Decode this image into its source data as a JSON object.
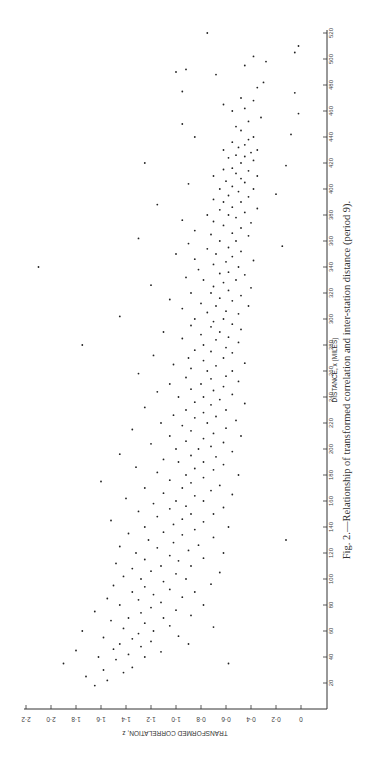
{
  "figure": {
    "caption": "Fig. 2.—Relationship of transformed correlation and inter-station distance (period 9).",
    "orientation": "rotated 90° counter-clockwise"
  },
  "chart_data": {
    "type": "scatter",
    "title": "Relationship of transformed correlation and inter-station distance (period 9)",
    "xlabel": "DISTANCE, x (MILES)",
    "ylabel": "TRANSFORMED CORRELATION, z",
    "xlim": [
      0,
      520
    ],
    "ylim": [
      0,
      2.2
    ],
    "x_ticks": [
      20,
      40,
      60,
      80,
      100,
      120,
      140,
      160,
      180,
      200,
      220,
      240,
      260,
      280,
      300,
      320,
      340,
      360,
      380,
      400,
      420,
      440,
      460,
      480,
      500,
      520
    ],
    "y_ticks": [
      "0",
      "0·2",
      "0·4",
      "0·6",
      "0·8",
      "1·0",
      "1·2",
      "1·4",
      "1·6",
      "1·8",
      "2·0",
      "2·2"
    ],
    "grid": false,
    "legend": null,
    "trend_description": "Dense cloud decreasing from z≈1.3 near 20 mi to z≈0.45 near 450 mi; scattered outliers up to z≈2.1",
    "points": [
      [
        18,
        1.65
      ],
      [
        22,
        1.55
      ],
      [
        25,
        1.72
      ],
      [
        28,
        1.42
      ],
      [
        30,
        1.58
      ],
      [
        32,
        1.35
      ],
      [
        35,
        1.9
      ],
      [
        35,
        0.58
      ],
      [
        38,
        1.48
      ],
      [
        40,
        1.25
      ],
      [
        40,
        1.62
      ],
      [
        42,
        1.38
      ],
      [
        44,
        1.12
      ],
      [
        45,
        1.8
      ],
      [
        46,
        1.5
      ],
      [
        48,
        1.28
      ],
      [
        50,
        1.45
      ],
      [
        50,
        0.9
      ],
      [
        52,
        1.2
      ],
      [
        54,
        1.35
      ],
      [
        55,
        1.58
      ],
      [
        56,
        0.98
      ],
      [
        58,
        1.3
      ],
      [
        60,
        1.18
      ],
      [
        60,
        1.75
      ],
      [
        62,
        1.42
      ],
      [
        63,
        0.7
      ],
      [
        64,
        1.05
      ],
      [
        66,
        1.25
      ],
      [
        68,
        1.52
      ],
      [
        70,
        1.1
      ],
      [
        70,
        1.38
      ],
      [
        72,
        0.88
      ],
      [
        74,
        1.28
      ],
      [
        75,
        1.65
      ],
      [
        76,
        1.0
      ],
      [
        78,
        1.2
      ],
      [
        80,
        1.45
      ],
      [
        80,
        0.78
      ],
      [
        82,
        1.12
      ],
      [
        84,
        1.3
      ],
      [
        85,
        1.55
      ],
      [
        86,
        0.95
      ],
      [
        88,
        1.18
      ],
      [
        90,
        1.35
      ],
      [
        90,
        0.85
      ],
      [
        92,
        1.05
      ],
      [
        94,
        1.25
      ],
      [
        95,
        1.5
      ],
      [
        96,
        0.72
      ],
      [
        98,
        1.1
      ],
      [
        100,
        1.28
      ],
      [
        100,
        0.92
      ],
      [
        102,
        1.42
      ],
      [
        104,
        1.0
      ],
      [
        105,
        0.65
      ],
      [
        106,
        1.2
      ],
      [
        108,
        1.35
      ],
      [
        110,
        0.88
      ],
      [
        110,
        1.12
      ],
      [
        112,
        1.48
      ],
      [
        114,
        0.98
      ],
      [
        115,
        1.25
      ],
      [
        116,
        0.78
      ],
      [
        118,
        1.05
      ],
      [
        120,
        1.32
      ],
      [
        120,
        0.62
      ],
      [
        122,
        0.9
      ],
      [
        124,
        1.15
      ],
      [
        125,
        1.45
      ],
      [
        126,
        0.82
      ],
      [
        128,
        1.02
      ],
      [
        130,
        1.22
      ],
      [
        130,
        0.12
      ],
      [
        132,
        0.7
      ],
      [
        134,
        0.95
      ],
      [
        135,
        1.38
      ],
      [
        136,
        1.1
      ],
      [
        138,
        0.85
      ],
      [
        140,
        1.25
      ],
      [
        140,
        0.58
      ],
      [
        142,
        1.02
      ],
      [
        144,
        0.78
      ],
      [
        145,
        1.52
      ],
      [
        146,
        0.95
      ],
      [
        148,
        1.15
      ],
      [
        150,
        0.7
      ],
      [
        150,
        0.88
      ],
      [
        152,
        1.3
      ],
      [
        154,
        1.05
      ],
      [
        155,
        0.62
      ],
      [
        156,
        0.92
      ],
      [
        158,
        1.18
      ],
      [
        160,
        0.78
      ],
      [
        160,
        1.0
      ],
      [
        162,
        1.4
      ],
      [
        164,
        0.85
      ],
      [
        165,
        0.55
      ],
      [
        166,
        1.1
      ],
      [
        168,
        0.72
      ],
      [
        170,
        0.95
      ],
      [
        170,
        1.25
      ],
      [
        172,
        0.65
      ],
      [
        174,
        0.88
      ],
      [
        175,
        1.6
      ],
      [
        176,
        1.05
      ],
      [
        178,
        0.78
      ],
      [
        180,
        0.92
      ],
      [
        180,
        0.5
      ],
      [
        182,
        1.15
      ],
      [
        184,
        0.7
      ],
      [
        185,
        0.85
      ],
      [
        186,
        1.32
      ],
      [
        188,
        0.62
      ],
      [
        190,
        0.98
      ],
      [
        190,
        0.78
      ],
      [
        192,
        1.1
      ],
      [
        194,
        0.68
      ],
      [
        195,
        0.88
      ],
      [
        196,
        1.45
      ],
      [
        198,
        0.55
      ],
      [
        200,
        0.82
      ],
      [
        200,
        1.0
      ],
      [
        202,
        0.72
      ],
      [
        204,
        1.2
      ],
      [
        205,
        0.62
      ],
      [
        206,
        0.92
      ],
      [
        208,
        0.78
      ],
      [
        210,
        1.05
      ],
      [
        210,
        0.48
      ],
      [
        212,
        0.7
      ],
      [
        214,
        0.88
      ],
      [
        215,
        1.35
      ],
      [
        216,
        0.6
      ],
      [
        218,
        0.95
      ],
      [
        220,
        0.75
      ],
      [
        220,
        1.12
      ],
      [
        222,
        0.52
      ],
      [
        224,
        0.85
      ],
      [
        225,
        0.68
      ],
      [
        226,
        1.02
      ],
      [
        228,
        0.78
      ],
      [
        230,
        0.6
      ],
      [
        230,
        0.92
      ],
      [
        232,
        1.25
      ],
      [
        234,
        0.72
      ],
      [
        235,
        0.45
      ],
      [
        236,
        0.85
      ],
      [
        238,
        0.65
      ],
      [
        240,
        0.98
      ],
      [
        240,
        0.78
      ],
      [
        242,
        0.55
      ],
      [
        244,
        1.15
      ],
      [
        245,
        0.7
      ],
      [
        246,
        0.88
      ],
      [
        248,
        0.62
      ],
      [
        250,
        0.8
      ],
      [
        250,
        1.05
      ],
      [
        252,
        0.5
      ],
      [
        254,
        0.72
      ],
      [
        255,
        0.92
      ],
      [
        256,
        0.6
      ],
      [
        258,
        1.3
      ],
      [
        260,
        0.75
      ],
      [
        260,
        0.55
      ],
      [
        262,
        0.88
      ],
      [
        264,
        0.68
      ],
      [
        265,
        1.02
      ],
      [
        266,
        0.45
      ],
      [
        268,
        0.78
      ],
      [
        270,
        0.62
      ],
      [
        270,
        0.9
      ],
      [
        272,
        1.18
      ],
      [
        274,
        0.55
      ],
      [
        275,
        0.72
      ],
      [
        276,
        0.85
      ],
      [
        278,
        0.6
      ],
      [
        280,
        0.78
      ],
      [
        280,
        1.75
      ],
      [
        282,
        0.5
      ],
      [
        284,
        0.68
      ],
      [
        285,
        0.95
      ],
      [
        286,
        0.58
      ],
      [
        288,
        0.8
      ],
      [
        290,
        0.65
      ],
      [
        290,
        1.1
      ],
      [
        292,
        0.48
      ],
      [
        294,
        0.72
      ],
      [
        295,
        0.88
      ],
      [
        296,
        0.55
      ],
      [
        298,
        0.7
      ],
      [
        300,
        0.62
      ],
      [
        300,
        0.85
      ],
      [
        302,
        1.45
      ],
      [
        304,
        0.5
      ],
      [
        305,
        0.75
      ],
      [
        306,
        0.6
      ],
      [
        308,
        0.95
      ],
      [
        310,
        0.68
      ],
      [
        310,
        0.42
      ],
      [
        312,
        0.8
      ],
      [
        314,
        0.55
      ],
      [
        315,
        1.05
      ],
      [
        316,
        0.65
      ],
      [
        318,
        0.48
      ],
      [
        320,
        0.72
      ],
      [
        320,
        0.88
      ],
      [
        322,
        0.58
      ],
      [
        324,
        0.4
      ],
      [
        325,
        0.7
      ],
      [
        326,
        1.2
      ],
      [
        328,
        0.62
      ],
      [
        330,
        0.52
      ],
      [
        330,
        0.78
      ],
      [
        332,
        0.92
      ],
      [
        334,
        0.45
      ],
      [
        335,
        0.65
      ],
      [
        336,
        0.58
      ],
      [
        338,
        0.82
      ],
      [
        340,
        0.5
      ],
      [
        340,
        2.1
      ],
      [
        342,
        0.7
      ],
      [
        344,
        0.6
      ],
      [
        345,
        0.38
      ],
      [
        346,
        0.85
      ],
      [
        348,
        0.55
      ],
      [
        350,
        0.68
      ],
      [
        350,
        1.0
      ],
      [
        352,
        0.48
      ],
      [
        354,
        0.75
      ],
      [
        355,
        0.58
      ],
      [
        356,
        0.15
      ],
      [
        358,
        0.9
      ],
      [
        360,
        0.52
      ],
      [
        360,
        0.65
      ],
      [
        362,
        1.3
      ],
      [
        364,
        0.42
      ],
      [
        365,
        0.72
      ],
      [
        366,
        0.55
      ],
      [
        368,
        0.85
      ],
      [
        370,
        0.48
      ],
      [
        372,
        0.62
      ],
      [
        374,
        0.4
      ],
      [
        375,
        0.7
      ],
      [
        376,
        0.95
      ],
      [
        378,
        0.52
      ],
      [
        380,
        0.58
      ],
      [
        380,
        0.75
      ],
      [
        382,
        0.45
      ],
      [
        384,
        0.65
      ],
      [
        385,
        0.35
      ],
      [
        386,
        0.55
      ],
      [
        388,
        1.15
      ],
      [
        390,
        0.48
      ],
      [
        390,
        0.62
      ],
      [
        392,
        0.7
      ],
      [
        394,
        0.42
      ],
      [
        395,
        0.58
      ],
      [
        396,
        0.2
      ],
      [
        398,
        0.5
      ],
      [
        400,
        0.65
      ],
      [
        400,
        0.38
      ],
      [
        402,
        0.55
      ],
      [
        404,
        0.9
      ],
      [
        405,
        0.45
      ],
      [
        406,
        0.6
      ],
      [
        408,
        0.48
      ],
      [
        410,
        0.35
      ],
      [
        410,
        0.7
      ],
      [
        412,
        0.52
      ],
      [
        414,
        0.42
      ],
      [
        415,
        0.62
      ],
      [
        416,
        0.55
      ],
      [
        418,
        0.12
      ],
      [
        420,
        0.48
      ],
      [
        420,
        1.25
      ],
      [
        422,
        0.38
      ],
      [
        424,
        0.58
      ],
      [
        425,
        0.45
      ],
      [
        426,
        0.52
      ],
      [
        428,
        0.4
      ],
      [
        430,
        0.62
      ],
      [
        430,
        0.35
      ],
      [
        432,
        0.5
      ],
      [
        434,
        0.45
      ],
      [
        436,
        0.55
      ],
      [
        438,
        0.42
      ],
      [
        440,
        0.38
      ],
      [
        440,
        0.85
      ],
      [
        442,
        0.08
      ],
      [
        445,
        0.48
      ],
      [
        448,
        0.52
      ],
      [
        450,
        0.95
      ],
      [
        452,
        0.42
      ],
      [
        455,
        0.32
      ],
      [
        458,
        0.02
      ],
      [
        460,
        0.55
      ],
      [
        462,
        0.45
      ],
      [
        465,
        0.62
      ],
      [
        468,
        0.38
      ],
      [
        470,
        0.48
      ],
      [
        474,
        0.05
      ],
      [
        475,
        0.95
      ],
      [
        478,
        0.35
      ],
      [
        482,
        0.3
      ],
      [
        488,
        0.68
      ],
      [
        490,
        1.0
      ],
      [
        492,
        0.92
      ],
      [
        495,
        0.45
      ],
      [
        498,
        0.28
      ],
      [
        502,
        0.38
      ],
      [
        505,
        0.05
      ],
      [
        510,
        0.02
      ],
      [
        520,
        0.75
      ]
    ]
  }
}
